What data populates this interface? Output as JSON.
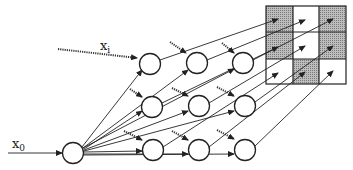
{
  "labels": {
    "x0": {
      "base": "x",
      "sub": "0"
    },
    "xi": {
      "base": "x",
      "sub": "i"
    }
  },
  "colors": {
    "stroke": "#222222",
    "shaded": "#a8a8a8",
    "background": "#ffffff"
  },
  "grid": {
    "rows": 3,
    "cols": 3,
    "shaded_cells": [
      [
        0,
        0
      ],
      [
        0,
        2
      ],
      [
        1,
        0
      ],
      [
        1,
        2
      ],
      [
        2,
        1
      ]
    ]
  },
  "nodes": {
    "input": {
      "label": "x0"
    },
    "layers": [
      {
        "rows": 3
      },
      {
        "rows": 3
      },
      {
        "rows": 3
      }
    ]
  }
}
